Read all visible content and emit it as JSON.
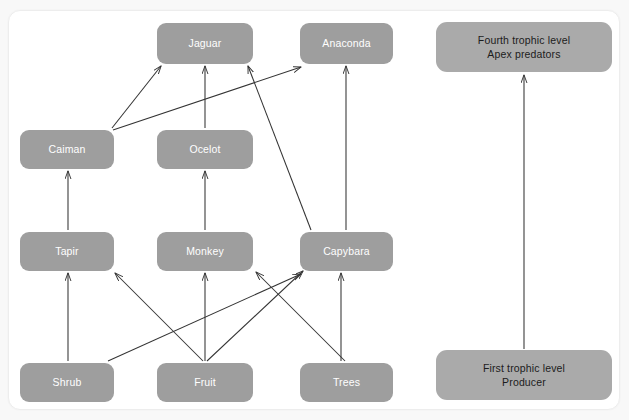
{
  "diagram": {
    "colors": {
      "node_fill": "#9e9e9e",
      "legend_node_fill": "#aaaaaa",
      "node_text": "#ffffff",
      "legend_node_text": "#1c1c1c",
      "edge_stroke": "#333333",
      "canvas_background": "#ffffff",
      "page_background": "#f8f8f8",
      "canvas_border": "#ededed"
    }
  },
  "nodes": {
    "jaguar": {
      "label": "Jaguar"
    },
    "anaconda": {
      "label": "Anaconda"
    },
    "caiman": {
      "label": "Caiman"
    },
    "ocelot": {
      "label": "Ocelot"
    },
    "tapir": {
      "label": "Tapir"
    },
    "monkey": {
      "label": "Monkey"
    },
    "capybara": {
      "label": "Capybara"
    },
    "shrub": {
      "label": "Shrub"
    },
    "fruit": {
      "label": "Fruit"
    },
    "trees": {
      "label": "Trees"
    },
    "fourth_trophic_level": {
      "label": "Fourth trophic level\nApex predators"
    },
    "first_trophic_level": {
      "label": "First trophic level\nProducer"
    }
  },
  "edges": [
    {
      "from": "caiman",
      "to": "jaguar",
      "name": "edge-caiman-to-jaguar"
    },
    {
      "from": "caiman",
      "to": "anaconda",
      "name": "edge-caiman-to-anaconda"
    },
    {
      "from": "ocelot",
      "to": "jaguar",
      "name": "edge-ocelot-to-jaguar"
    },
    {
      "from": "capybara",
      "to": "jaguar",
      "name": "edge-capybara-to-jaguar"
    },
    {
      "from": "capybara",
      "to": "anaconda",
      "name": "edge-capybara-to-anaconda"
    },
    {
      "from": "tapir",
      "to": "caiman",
      "name": "edge-tapir-to-caiman"
    },
    {
      "from": "monkey",
      "to": "ocelot",
      "name": "edge-monkey-to-ocelot"
    },
    {
      "from": "shrub",
      "to": "tapir",
      "name": "edge-shrub-to-tapir"
    },
    {
      "from": "shrub",
      "to": "capybara",
      "name": "edge-shrub-to-capybara"
    },
    {
      "from": "fruit",
      "to": "tapir",
      "name": "edge-fruit-to-tapir"
    },
    {
      "from": "fruit",
      "to": "monkey",
      "name": "edge-fruit-to-monkey"
    },
    {
      "from": "fruit",
      "to": "capybara",
      "name": "edge-fruit-to-capybara"
    },
    {
      "from": "trees",
      "to": "monkey",
      "name": "edge-trees-to-monkey"
    },
    {
      "from": "trees",
      "to": "capybara",
      "name": "edge-trees-to-capybara"
    },
    {
      "from": "first_trophic_level",
      "to": "fourth_trophic_level",
      "name": "edge-first-to-fourth-trophic-level"
    }
  ]
}
